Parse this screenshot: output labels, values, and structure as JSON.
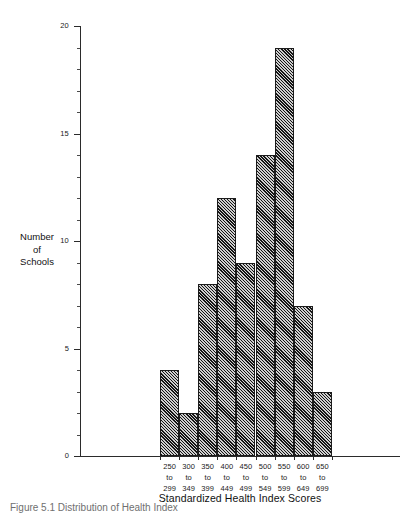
{
  "chart_data": {
    "type": "bar",
    "title": "",
    "subtitle": "",
    "xlabel": "Standardized Health Index Scores",
    "ylabel": "Number of Schools",
    "ylabel_lines": [
      "Number",
      "of",
      "Schools"
    ],
    "categories": [
      "250 to 299",
      "300 to 349",
      "350 to 399",
      "400 to 449",
      "450 to 499",
      "500 to 549",
      "550 to 599",
      "600 to 649",
      "650 to 699"
    ],
    "category_lines": [
      {
        "start": "250",
        "to": "to",
        "end": "299"
      },
      {
        "start": "300",
        "to": "to",
        "end": "349"
      },
      {
        "start": "350",
        "to": "to",
        "end": "399"
      },
      {
        "start": "400",
        "to": "to",
        "end": "449"
      },
      {
        "start": "450",
        "to": "to",
        "end": "499"
      },
      {
        "start": "500",
        "to": "to",
        "end": "549"
      },
      {
        "start": "550",
        "to": "to",
        "end": "599"
      },
      {
        "start": "600",
        "to": "to",
        "end": "649"
      },
      {
        "start": "650",
        "to": "to",
        "end": "699"
      }
    ],
    "values": [
      4,
      2,
      8,
      12,
      9,
      14,
      19,
      7,
      3
    ],
    "ylim": [
      0,
      20
    ],
    "y_major_ticks": [
      0,
      5,
      10,
      15,
      20
    ],
    "y_major_tick_labels": [
      "0",
      "5",
      "10",
      "15",
      "20"
    ],
    "y_minor_tick_step": 1,
    "grid": false,
    "legend": false,
    "legend_position": "none",
    "bar_style": "diagonal-hatch",
    "colors": {
      "axis": "#2b2b2b",
      "bar_edge": "#1c1c1c",
      "bar_hatch": "#141414",
      "bar_fill": "#cfcfcf",
      "text": "#1a1a1a",
      "caption": "#8c8c8c",
      "background": "#ffffff"
    }
  },
  "caption": {
    "label": "Figure",
    "text": "Figure  5.1   Distribution of Health Index"
  }
}
